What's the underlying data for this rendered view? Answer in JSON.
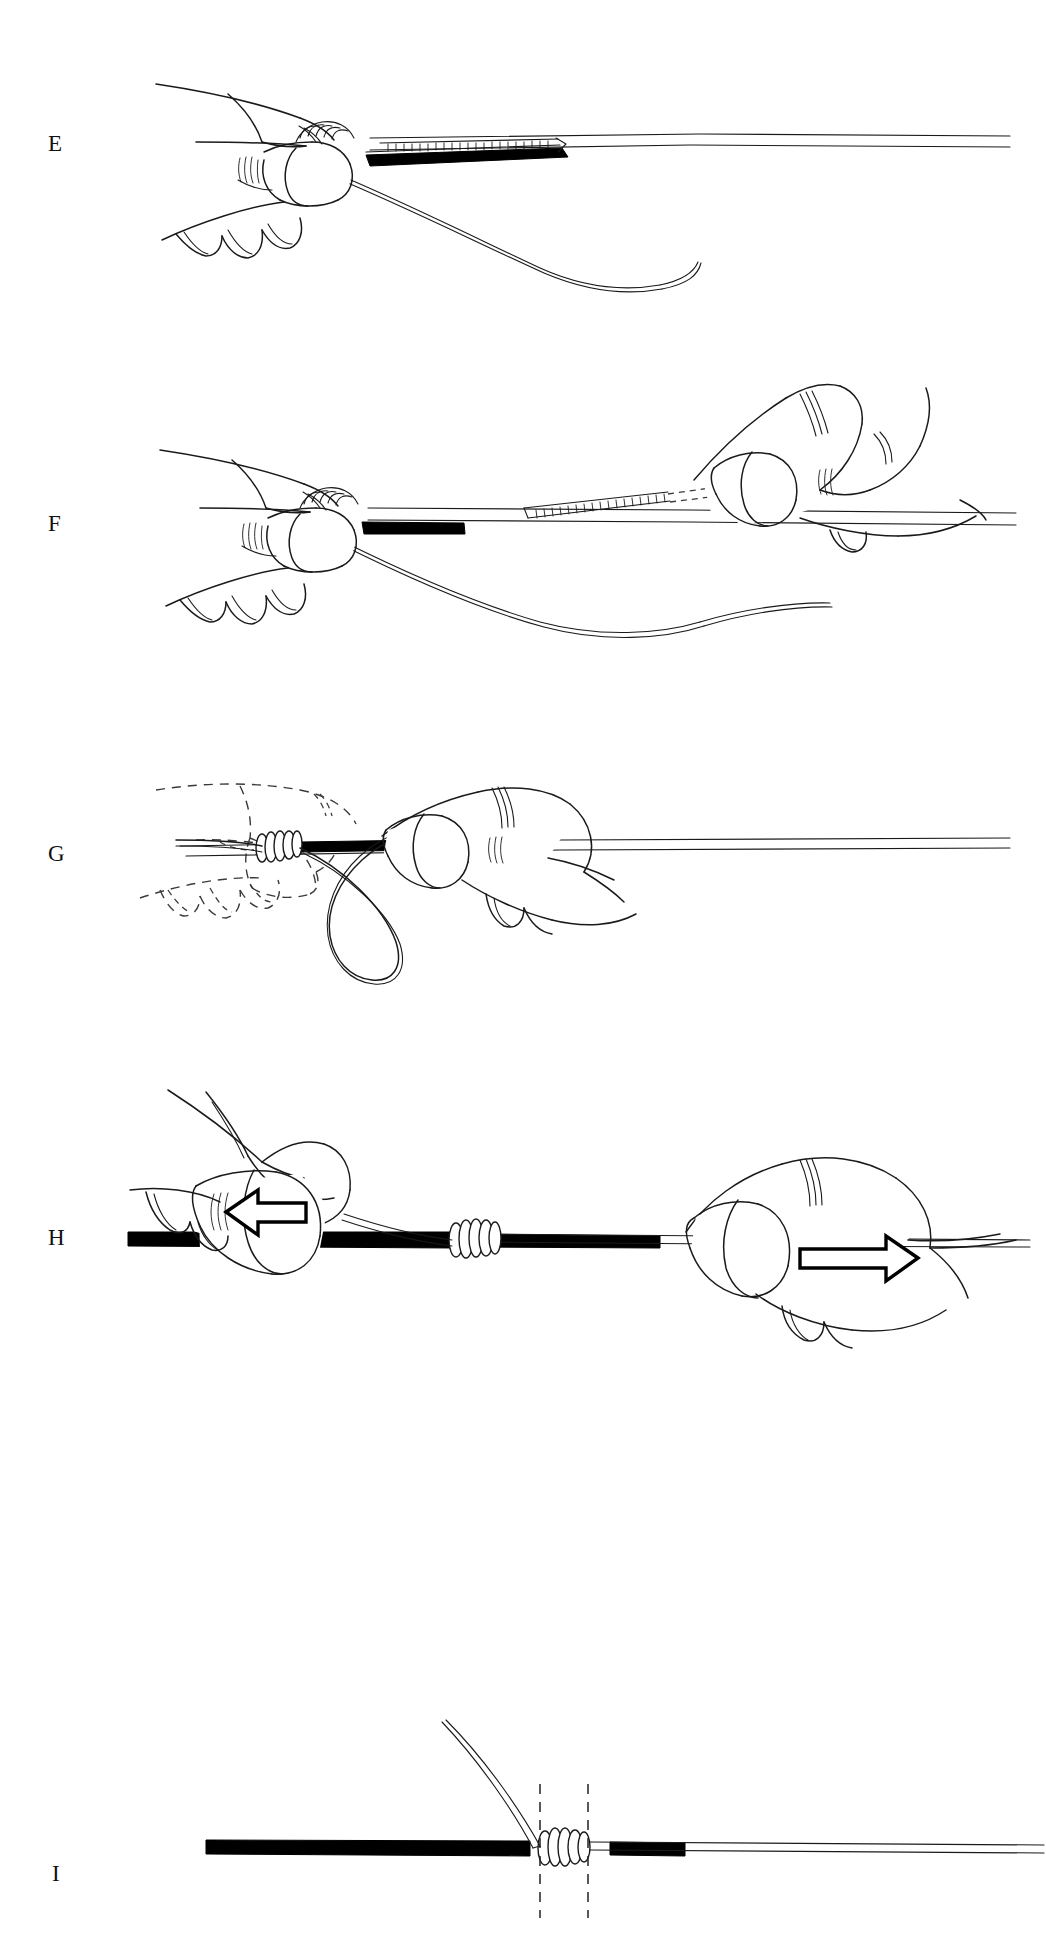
{
  "figure": {
    "kind": "surgical-technique-line-drawing",
    "background_color": "#ffffff",
    "ink_color": "#1a1a1a",
    "width": 1046,
    "height": 1939
  },
  "panels": [
    {
      "id": "E",
      "label": "E",
      "label_x": 48,
      "label_y": 132,
      "caption_text": "",
      "elements": [
        {
          "name": "left-hand-grip",
          "type": "hand",
          "style": "solid"
        },
        {
          "name": "tube",
          "type": "tube",
          "style": "solid-outline"
        },
        {
          "name": "black-rod",
          "type": "rod",
          "style": "filled-black"
        },
        {
          "name": "suture-strand",
          "type": "thread",
          "style": "solid"
        },
        {
          "name": "curved-needle",
          "type": "needle",
          "style": "solid"
        }
      ]
    },
    {
      "id": "F",
      "label": "F",
      "label_x": 48,
      "label_y": 512,
      "caption_text": "",
      "elements": [
        {
          "name": "left-hand-grip",
          "type": "hand",
          "style": "solid"
        },
        {
          "name": "right-hand-grip",
          "type": "hand",
          "style": "solid"
        },
        {
          "name": "tube",
          "type": "tube",
          "style": "solid-outline"
        },
        {
          "name": "black-rod",
          "type": "rod",
          "style": "filled-black"
        },
        {
          "name": "suture-strand",
          "type": "thread",
          "style": "solid"
        },
        {
          "name": "straight-needle",
          "type": "needle",
          "style": "solid"
        },
        {
          "name": "hidden-needle-path",
          "type": "needle-path",
          "style": "dashed"
        }
      ]
    },
    {
      "id": "G",
      "label": "G",
      "label_x": 48,
      "label_y": 840,
      "caption_text": "",
      "elements": [
        {
          "name": "ghost-hand-previous-position",
          "type": "hand",
          "style": "dashed"
        },
        {
          "name": "right-hand-grip",
          "type": "hand",
          "style": "solid"
        },
        {
          "name": "coiled-knot",
          "type": "knot",
          "style": "solid"
        },
        {
          "name": "suture-loop",
          "type": "thread-loop",
          "style": "solid"
        },
        {
          "name": "tube",
          "type": "tube",
          "style": "solid-outline"
        }
      ]
    },
    {
      "id": "H",
      "label": "H",
      "label_x": 48,
      "label_y": 1226,
      "caption_text": "",
      "elements": [
        {
          "name": "left-hand-grip",
          "type": "hand",
          "style": "solid"
        },
        {
          "name": "right-hand-grip",
          "type": "hand",
          "style": "solid"
        },
        {
          "name": "left-pull-arrow",
          "type": "arrow",
          "direction": "left"
        },
        {
          "name": "right-pull-arrow",
          "type": "arrow",
          "direction": "right"
        },
        {
          "name": "coiled-knot",
          "type": "knot",
          "style": "solid"
        },
        {
          "name": "black-tube",
          "type": "tube",
          "style": "filled-black"
        },
        {
          "name": "suture-strand",
          "type": "thread",
          "style": "solid"
        }
      ]
    },
    {
      "id": "I",
      "label": "I",
      "label_x": 52,
      "label_y": 1460,
      "caption_text": "",
      "elements": [
        {
          "name": "black-tube",
          "type": "tube",
          "style": "filled-black"
        },
        {
          "name": "coiled-knot",
          "type": "knot",
          "style": "solid"
        },
        {
          "name": "cut-needle",
          "type": "needle",
          "style": "solid"
        },
        {
          "name": "cut-line-left",
          "type": "guide-line",
          "style": "dashed-vertical"
        },
        {
          "name": "cut-line-right",
          "type": "guide-line",
          "style": "dashed-vertical"
        },
        {
          "name": "suture-tail",
          "type": "thread",
          "style": "solid"
        }
      ]
    }
  ],
  "colors": {
    "ink": "#1a1a1a",
    "fill_black": "#000000",
    "paper": "#ffffff",
    "dashed_ghost": "#3a3a3a"
  }
}
